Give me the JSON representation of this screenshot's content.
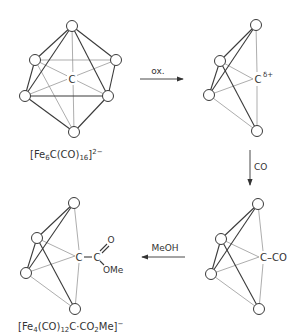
{
  "colors": {
    "ink": "#333333",
    "front_bond": "#3a3a3a",
    "back_bond": "#8a8a8a",
    "background": "#ffffff"
  },
  "compounds": [
    {
      "id": "fe6",
      "geometry": "octahedron",
      "center_label": "C",
      "formula": {
        "prefix": "[Fe",
        "sub1": "6",
        "mid": "C(CO)",
        "sub2": "16",
        "suffix": "]",
        "charge": "2−"
      }
    },
    {
      "id": "fe4-cation",
      "geometry": "butterfly",
      "center_label": "C",
      "charge_label": "δ+"
    },
    {
      "id": "fe4-co",
      "geometry": "butterfly",
      "center_label": "C–CO"
    },
    {
      "id": "fe4-ester",
      "geometry": "butterfly",
      "center_label": "C",
      "substituent": {
        "carbon": "C",
        "carbonyl_o": "O",
        "alkoxy": "OMe"
      },
      "formula": {
        "prefix": "[Fe",
        "sub1": "4",
        "mid": "(CO)",
        "sub2": "12",
        "mid2": "C·CO",
        "sub3": "2",
        "end": "Me]",
        "charge": "−"
      }
    }
  ],
  "arrows": [
    {
      "id": "oxidation",
      "label": "ox.",
      "direction": "right"
    },
    {
      "id": "carbonylation",
      "label": "CO",
      "direction": "down"
    },
    {
      "id": "methanolysis",
      "label": "MeOH",
      "direction": "left"
    }
  ]
}
